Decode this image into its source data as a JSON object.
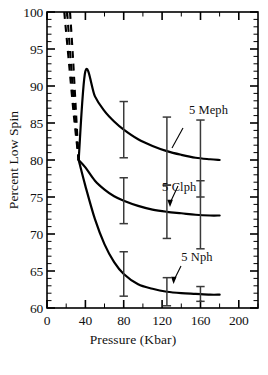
{
  "chart_data": {
    "type": "line",
    "title": "",
    "xlabel": "Pressure (Kbar)",
    "ylabel": "Percent Low Spin",
    "xlim": [
      0,
      220
    ],
    "ylim": [
      60,
      100
    ],
    "xticks": [
      0,
      40,
      80,
      120,
      160,
      200
    ],
    "xtick_labels": [
      "0",
      "40",
      "80",
      "120",
      "160",
      "200"
    ],
    "yticks": [
      60,
      65,
      70,
      75,
      80,
      85,
      90,
      95,
      100
    ],
    "ytick_labels": [
      "60",
      "65",
      "70",
      "75",
      "80",
      "85",
      "90",
      "95",
      "100"
    ],
    "x_minor_interval": 10,
    "y_minor_interval": 1,
    "grid": false,
    "legend_position": "inline-annotations",
    "series": [
      {
        "name": "5 Meph",
        "label": "5 Meph",
        "label_x": 148,
        "label_y": 86.2,
        "leader": "line",
        "solid_points": [
          [
            33,
            80.0
          ],
          [
            40,
            92.0
          ],
          [
            50,
            88.6
          ],
          [
            60,
            86.6
          ],
          [
            70,
            85.2
          ],
          [
            80,
            84.1
          ],
          [
            95,
            82.8
          ],
          [
            110,
            81.9
          ],
          [
            125,
            81.2
          ],
          [
            140,
            80.7
          ],
          [
            155,
            80.3
          ],
          [
            170,
            80.1
          ],
          [
            180,
            80.0
          ]
        ],
        "dashed_points": [
          [
            24,
            100.0
          ],
          [
            27,
            94.0
          ],
          [
            30,
            87.0
          ],
          [
            33,
            80.0
          ]
        ],
        "errorbars": [
          {
            "x": 80,
            "y": 84.1,
            "lower": 80.3,
            "upper": 87.9
          },
          {
            "x": 125,
            "y": 81.2,
            "lower": 76.6,
            "upper": 85.8
          },
          {
            "x": 160,
            "y": 80.2,
            "lower": 75.0,
            "upper": 85.4
          }
        ]
      },
      {
        "name": "5 Clph",
        "label": "5 Clph",
        "label_x": 120,
        "label_y": 75.8,
        "leader": "arrow",
        "solid_points": [
          [
            33,
            80.0
          ],
          [
            40,
            79.0
          ],
          [
            50,
            77.2
          ],
          [
            60,
            76.0
          ],
          [
            70,
            75.1
          ],
          [
            80,
            74.5
          ],
          [
            95,
            73.8
          ],
          [
            110,
            73.3
          ],
          [
            125,
            73.0
          ],
          [
            140,
            72.8
          ],
          [
            155,
            72.6
          ],
          [
            170,
            72.5
          ],
          [
            180,
            72.5
          ]
        ],
        "dashed_points": [
          [
            21,
            100.0
          ],
          [
            25,
            93.0
          ],
          [
            29,
            86.0
          ],
          [
            33,
            80.0
          ]
        ],
        "errorbars": [
          {
            "x": 80,
            "y": 74.5,
            "lower": 71.4,
            "upper": 77.6
          },
          {
            "x": 125,
            "y": 73.0,
            "lower": 69.4,
            "upper": 76.6
          },
          {
            "x": 160,
            "y": 72.6,
            "lower": 68.0,
            "upper": 77.2
          }
        ]
      },
      {
        "name": "5 Nph",
        "label": "5 Nph",
        "label_x": 140,
        "label_y": 66.4,
        "leader": "arrow",
        "solid_points": [
          [
            33,
            80.0
          ],
          [
            40,
            76.5
          ],
          [
            50,
            72.0
          ],
          [
            60,
            68.6
          ],
          [
            70,
            66.2
          ],
          [
            80,
            64.6
          ],
          [
            95,
            63.2
          ],
          [
            110,
            62.6
          ],
          [
            125,
            62.2
          ],
          [
            140,
            62.0
          ],
          [
            155,
            61.9
          ],
          [
            170,
            61.8
          ],
          [
            180,
            61.8
          ]
        ],
        "dashed_points": [
          [
            18,
            100.0
          ],
          [
            23,
            93.0
          ],
          [
            28,
            86.0
          ],
          [
            33,
            80.0
          ]
        ],
        "errorbars": [
          {
            "x": 80,
            "y": 64.6,
            "lower": 61.6,
            "upper": 67.6
          },
          {
            "x": 125,
            "y": 62.2,
            "lower": 60.3,
            "upper": 64.1
          },
          {
            "x": 160,
            "y": 61.9,
            "lower": 60.9,
            "upper": 62.9
          }
        ]
      }
    ]
  },
  "figure": {
    "axis_color": "#000000",
    "curve_color": "#000000",
    "errorbar_color": "#3a3a3a",
    "background": "#ffffff"
  }
}
